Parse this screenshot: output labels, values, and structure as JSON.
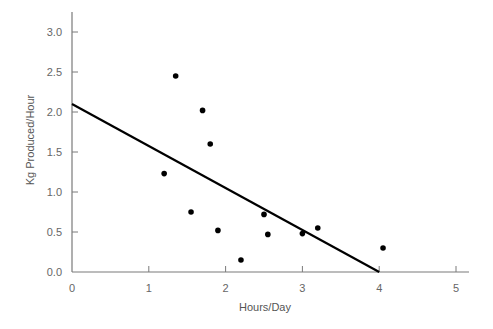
{
  "chart_data": {
    "type": "scatter",
    "title": "",
    "xlabel": "Hours/Day",
    "ylabel": "Kg Produced/Hour",
    "xlim": [
      0,
      5
    ],
    "ylim": [
      0,
      3.0
    ],
    "x_ticks": [
      "0",
      "1",
      "2",
      "3",
      "4",
      "5"
    ],
    "y_ticks": [
      "0.0",
      "0.5",
      "1.0",
      "1.5",
      "2.0",
      "2.5",
      "3.0"
    ],
    "grid": false,
    "legend": null,
    "series": [
      {
        "name": "observations",
        "type": "scatter",
        "points": [
          {
            "x": 1.2,
            "y": 1.23
          },
          {
            "x": 1.35,
            "y": 2.45
          },
          {
            "x": 1.55,
            "y": 0.75
          },
          {
            "x": 1.7,
            "y": 2.02
          },
          {
            "x": 1.8,
            "y": 1.6
          },
          {
            "x": 1.9,
            "y": 0.52
          },
          {
            "x": 2.2,
            "y": 0.15
          },
          {
            "x": 2.5,
            "y": 0.72
          },
          {
            "x": 2.55,
            "y": 0.47
          },
          {
            "x": 3.0,
            "y": 0.48
          },
          {
            "x": 3.2,
            "y": 0.55
          },
          {
            "x": 4.05,
            "y": 0.3
          }
        ]
      },
      {
        "name": "fit-line",
        "type": "line",
        "points": [
          {
            "x": 0,
            "y": 2.1
          },
          {
            "x": 4.0,
            "y": 0.0
          }
        ]
      }
    ]
  },
  "colors": {
    "axis": "#7a7a7a",
    "tick_text": "#666666",
    "points": "#000000",
    "line": "#000000"
  }
}
